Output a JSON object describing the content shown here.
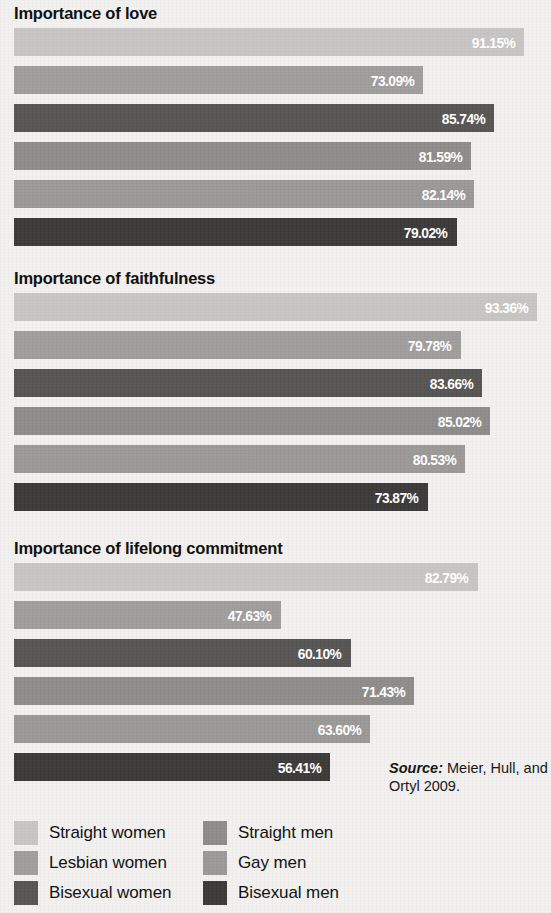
{
  "chart_data": [
    {
      "type": "bar",
      "orientation": "horizontal",
      "title": "Importance of love",
      "xlabel": "",
      "ylabel": "",
      "xlim": [
        0,
        100
      ],
      "grid": false,
      "categories": [
        "Straight women",
        "Lesbian women",
        "Bisexual women",
        "Straight men",
        "Gay men",
        "Bisexual men"
      ],
      "values": [
        91.15,
        73.09,
        85.74,
        81.59,
        82.14,
        79.02
      ],
      "value_labels": [
        "91.15%",
        "73.09%",
        "85.74%",
        "81.59%",
        "82.14%",
        "79.02%"
      ]
    },
    {
      "type": "bar",
      "orientation": "horizontal",
      "title": "Importance of faithfulness",
      "xlabel": "",
      "ylabel": "",
      "xlim": [
        0,
        100
      ],
      "grid": false,
      "categories": [
        "Straight women",
        "Lesbian women",
        "Bisexual women",
        "Straight men",
        "Gay men",
        "Bisexual men"
      ],
      "values": [
        93.36,
        79.78,
        83.66,
        85.02,
        80.53,
        73.87
      ],
      "value_labels": [
        "93.36%",
        "79.78%",
        "83.66%",
        "85.02%",
        "80.53%",
        "73.87%"
      ]
    },
    {
      "type": "bar",
      "orientation": "horizontal",
      "title": "Importance of lifelong commitment",
      "xlabel": "",
      "ylabel": "",
      "xlim": [
        0,
        100
      ],
      "grid": false,
      "categories": [
        "Straight women",
        "Lesbian women",
        "Bisexual women",
        "Straight men",
        "Gay men",
        "Bisexual men"
      ],
      "values": [
        82.79,
        47.63,
        60.1,
        71.43,
        63.6,
        56.41
      ],
      "value_labels": [
        "82.79%",
        "47.63%",
        "60.10%",
        "71.43%",
        "63.60%",
        "56.41%"
      ]
    }
  ],
  "series_colors": {
    "straight_women": "#c7c6c4",
    "lesbian_women": "#9f9e9c",
    "bisexual_women": "#565554",
    "straight_men": "#8d8c8a",
    "gay_men": "#9a9997",
    "bisexual_men": "#3b3a39"
  },
  "panels": [
    {
      "title": "Importance of love"
    },
    {
      "title": "Importance of faithfulness"
    },
    {
      "title": "Importance of lifelong commitment"
    }
  ],
  "legend": {
    "position": "bottom",
    "left_column": [
      {
        "label": "Straight women",
        "color": "#c7c6c4"
      },
      {
        "label": "Lesbian women",
        "color": "#9f9e9c"
      },
      {
        "label": "Bisexual women",
        "color": "#565554"
      }
    ],
    "right_column": [
      {
        "label": "Straight men",
        "color": "#8d8c8a"
      },
      {
        "label": "Gay men",
        "color": "#9a9997"
      },
      {
        "label": "Bisexual men",
        "color": "#3b3a39"
      }
    ]
  },
  "source": {
    "label": "Source:",
    "text": " Meier, Hull, and Ortyl 2009."
  },
  "layout": {
    "bar_origin_x": 14,
    "px_per_percent": 5.6,
    "panel_tops": [
      4,
      269,
      539
    ]
  }
}
